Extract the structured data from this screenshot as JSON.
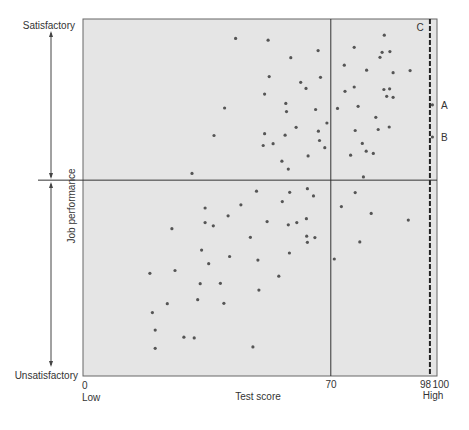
{
  "figure": {
    "y_axis": {
      "title": "Job performance",
      "top_label": "Satisfactory",
      "bottom_label": "Unsatisfactory"
    },
    "x_axis": {
      "title": "Test score",
      "low_label": "Low",
      "high_label": "High",
      "tick_labels": [
        "0",
        "70",
        "98",
        "100"
      ]
    },
    "markers": {
      "a": "A",
      "b": "B",
      "c": "C"
    }
  },
  "colors": {
    "plot_background": "#e5e5e5",
    "plot_border": "#666666",
    "point": "#555555",
    "reference_line": "#333333",
    "dashed_line": "#222222",
    "text": "#333333"
  },
  "chart_data": {
    "type": "scatter",
    "title": "",
    "xlabel": "Test score",
    "ylabel": "Job performance",
    "xlim": [
      0,
      100
    ],
    "ylim": [
      0,
      100
    ],
    "x_ticks": [
      0,
      70,
      98,
      100
    ],
    "x_tick_labels": [
      "0",
      "70",
      "98",
      "100"
    ],
    "x_end_labels": {
      "low": "Low",
      "high": "High"
    },
    "y_end_labels": {
      "bottom": "Unsatisfactory",
      "top": "Satisfactory"
    },
    "grid": false,
    "legend": null,
    "reference_lines": [
      {
        "orientation": "vertical",
        "x": 70,
        "style": "solid"
      },
      {
        "orientation": "vertical",
        "x": 98,
        "style": "dashed",
        "label": "C"
      },
      {
        "orientation": "horizontal",
        "y": 55,
        "style": "solid"
      }
    ],
    "annotations": [
      {
        "label": "A",
        "x": 98.7,
        "y": 76.1
      },
      {
        "label": "B",
        "x": 98.7,
        "y": 67.1
      },
      {
        "label": "C",
        "x": 98,
        "y": 97
      }
    ],
    "points": [
      [
        30.8,
        56.9
      ],
      [
        43.1,
        94.7
      ],
      [
        52.3,
        94.2
      ],
      [
        66.4,
        91.3
      ],
      [
        58.7,
        89.3
      ],
      [
        52.6,
        84.0
      ],
      [
        67.1,
        83.8
      ],
      [
        61.5,
        82.4
      ],
      [
        63.0,
        80.7
      ],
      [
        51.3,
        79.1
      ],
      [
        57.3,
        76.5
      ],
      [
        40.0,
        75.2
      ],
      [
        57.5,
        74.2
      ],
      [
        65.7,
        74.8
      ],
      [
        68.9,
        71.0
      ],
      [
        60.2,
        69.8
      ],
      [
        37.0,
        67.5
      ],
      [
        51.3,
        68.0
      ],
      [
        57.1,
        67.6
      ],
      [
        66.5,
        68.7
      ],
      [
        66.8,
        66.1
      ],
      [
        50.9,
        64.7
      ],
      [
        53.7,
        65.2
      ],
      [
        68.3,
        64.1
      ],
      [
        63.6,
        61.8
      ],
      [
        56.2,
        60.3
      ],
      [
        58.0,
        58.1
      ],
      [
        85.1,
        95.6
      ],
      [
        76.6,
        92.2
      ],
      [
        84.5,
        90.8
      ],
      [
        86.7,
        91.0
      ],
      [
        83.9,
        89.4
      ],
      [
        73.8,
        87.2
      ],
      [
        80.1,
        85.8
      ],
      [
        87.6,
        85.1
      ],
      [
        92.4,
        85.7
      ],
      [
        76.6,
        81.1
      ],
      [
        74.0,
        79.9
      ],
      [
        85.0,
        80.4
      ],
      [
        86.6,
        80.6
      ],
      [
        85.8,
        78.5
      ],
      [
        87.6,
        78.2
      ],
      [
        98.7,
        76.1
      ],
      [
        77.7,
        75.7
      ],
      [
        71.9,
        75.1
      ],
      [
        82.7,
        72.6
      ],
      [
        76.9,
        68.9
      ],
      [
        83.4,
        69.2
      ],
      [
        86.5,
        69.9
      ],
      [
        98.7,
        67.1
      ],
      [
        78.9,
        65.3
      ],
      [
        80.0,
        63.1
      ],
      [
        82.0,
        62.5
      ],
      [
        75.6,
        62.0
      ],
      [
        79.2,
        55.9
      ],
      [
        34.5,
        47.2
      ],
      [
        34.5,
        43.1
      ],
      [
        25.1,
        41.4
      ],
      [
        33.5,
        35.4
      ],
      [
        35.5,
        31.6
      ],
      [
        26.0,
        29.7
      ],
      [
        18.9,
        28.9
      ],
      [
        33.1,
        26.0
      ],
      [
        32.4,
        21.5
      ],
      [
        23.8,
        20.4
      ],
      [
        19.6,
        17.9
      ],
      [
        20.4,
        13.0
      ],
      [
        28.5,
        11.0
      ],
      [
        31.4,
        10.8
      ],
      [
        20.4,
        7.9
      ],
      [
        49.0,
        51.9
      ],
      [
        58.4,
        51.6
      ],
      [
        63.4,
        52.6
      ],
      [
        65.1,
        50.6
      ],
      [
        44.6,
        48.1
      ],
      [
        56.3,
        49.0
      ],
      [
        41.0,
        45.0
      ],
      [
        36.8,
        42.2
      ],
      [
        52.0,
        43.4
      ],
      [
        58.0,
        42.5
      ],
      [
        60.4,
        43.1
      ],
      [
        63.1,
        44.2
      ],
      [
        47.3,
        39.0
      ],
      [
        63.2,
        39.3
      ],
      [
        65.5,
        38.9
      ],
      [
        63.4,
        37.6
      ],
      [
        41.4,
        33.6
      ],
      [
        49.4,
        32.6
      ],
      [
        58.3,
        34.6
      ],
      [
        71.0,
        32.9
      ],
      [
        55.3,
        28.1
      ],
      [
        38.8,
        26.1
      ],
      [
        49.7,
        24.2
      ],
      [
        39.8,
        20.5
      ],
      [
        48.0,
        8.3
      ],
      [
        76.9,
        51.5
      ],
      [
        73.0,
        47.6
      ],
      [
        81.4,
        45.7
      ],
      [
        91.9,
        43.8
      ],
      [
        78.2,
        37.7
      ]
    ]
  }
}
